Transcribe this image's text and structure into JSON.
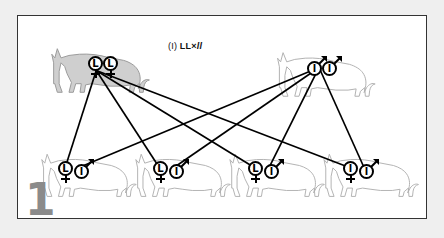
{
  "figure": {
    "plate_number": "1",
    "title": {
      "prefix": "(I)",
      "cross_dominant": "LL",
      "times": "×",
      "cross_recessive": "ll",
      "full": "(I) LL×ll"
    },
    "background_color": "#efefef",
    "panel_color": "#ffffff",
    "border_color": "#333333",
    "shaded_cat_fill": "#cfcfcf",
    "outline_cat_fill": "#ffffff"
  },
  "parents": [
    {
      "id": "parent-left",
      "sex": "female",
      "sex_symbol": "♀",
      "genotype": "LL",
      "alleles": [
        "L",
        "L"
      ],
      "phenotype_shaded": true,
      "position": {
        "x": 30,
        "y": 20
      }
    },
    {
      "id": "parent-right",
      "sex": "male",
      "sex_symbol": "♂",
      "genotype": "ll",
      "alleles": [
        "l",
        "l"
      ],
      "phenotype_shaded": false,
      "position": {
        "x": 265,
        "y": 22
      }
    }
  ],
  "offspring": [
    {
      "id": "offspring-1",
      "genotype": "Ll",
      "alleles": [
        {
          "letter": "L",
          "sex": "female",
          "sex_symbol": "♀"
        },
        {
          "letter": "l",
          "sex": "male",
          "sex_symbol": "♂"
        }
      ],
      "phenotype_shaded": false
    },
    {
      "id": "offspring-2",
      "genotype": "Ll",
      "alleles": [
        {
          "letter": "L",
          "sex": "female",
          "sex_symbol": "♀"
        },
        {
          "letter": "l",
          "sex": "male",
          "sex_symbol": "♂"
        }
      ],
      "phenotype_shaded": false
    },
    {
      "id": "offspring-3",
      "genotype": "Ll",
      "alleles": [
        {
          "letter": "L",
          "sex": "female",
          "sex_symbol": "♀"
        },
        {
          "letter": "l",
          "sex": "male",
          "sex_symbol": "♂"
        }
      ],
      "phenotype_shaded": false
    },
    {
      "id": "offspring-4",
      "genotype": "ll",
      "alleles": [
        {
          "letter": "l",
          "sex": "female",
          "sex_symbol": "♀"
        },
        {
          "letter": "l",
          "sex": "male",
          "sex_symbol": "♂"
        }
      ],
      "phenotype_shaded": false
    }
  ]
}
